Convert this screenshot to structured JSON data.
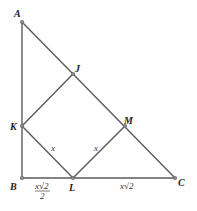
{
  "diagram": {
    "points": {
      "A": {
        "label": "A",
        "x": 22,
        "y": 22
      },
      "B": {
        "label": "B",
        "x": 22,
        "y": 178
      },
      "C": {
        "label": "C",
        "x": 175,
        "y": 178
      },
      "J": {
        "label": "J",
        "x": 73,
        "y": 74
      },
      "K": {
        "label": "K",
        "x": 22,
        "y": 126
      },
      "L": {
        "label": "L",
        "x": 73,
        "y": 178
      },
      "M": {
        "label": "M",
        "x": 125,
        "y": 126
      }
    },
    "segment_labels": {
      "KL": "x",
      "LM": "x",
      "BL_num": "x√2",
      "BL_den": "2",
      "LC": "x√2"
    },
    "colors": {
      "line": "#555555",
      "point": "#777777"
    }
  }
}
